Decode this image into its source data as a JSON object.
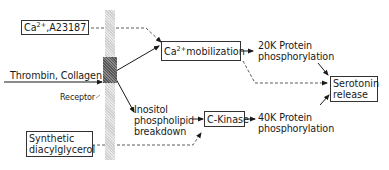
{
  "diagram": {
    "type": "signaling-pathway",
    "nodes": {
      "ionophore": {
        "prefix": "Ca",
        "superscript": "2+",
        "suffix": ",A23187"
      },
      "agonists": "Thrombin, Collagen",
      "receptor": "Receptor",
      "synthetic_dag": [
        "Synthetic",
        "diacylglycerol"
      ],
      "ca_mobilization": {
        "prefix": "Ca",
        "superscript": "2+",
        "suffix": "mobilization"
      },
      "inositol": [
        "Inositol",
        "phospholipid",
        "breakdown"
      ],
      "c_kinase": "C-Kinase",
      "p20k": [
        "20K Protein",
        "phosphorylation"
      ],
      "p40k": [
        "40K Protein",
        "phosphorylation"
      ],
      "serotonin": [
        "Serotonin",
        "release"
      ]
    },
    "edges": [
      {
        "from": "Ca2+,A23187",
        "to": "Ca2+ mobilization",
        "style": "dashed"
      },
      {
        "from": "Thrombin, Collagen",
        "to": "Receptor",
        "style": "solid"
      },
      {
        "from": "Receptor",
        "to": "Ca2+ mobilization",
        "style": "solid"
      },
      {
        "from": "Receptor",
        "to": "Inositol phospholipid breakdown",
        "style": "solid"
      },
      {
        "from": "Inositol phospholipid breakdown",
        "to": "C-Kinase",
        "style": "solid"
      },
      {
        "from": "Synthetic diacylglycerol",
        "to": "C-Kinase",
        "style": "dashed"
      },
      {
        "from": "Ca2+ mobilization",
        "to": "20K Protein phosphorylation",
        "style": "solid"
      },
      {
        "from": "Ca2+ mobilization",
        "to": "Serotonin release",
        "style": "dashed"
      },
      {
        "from": "C-Kinase",
        "to": "40K Protein phosphorylation",
        "style": "solid"
      },
      {
        "from": "20K Protein phosphorylation",
        "to": "Serotonin release",
        "style": "solid"
      },
      {
        "from": "40K Protein phosphorylation",
        "to": "Serotonin release",
        "style": "solid"
      }
    ]
  }
}
